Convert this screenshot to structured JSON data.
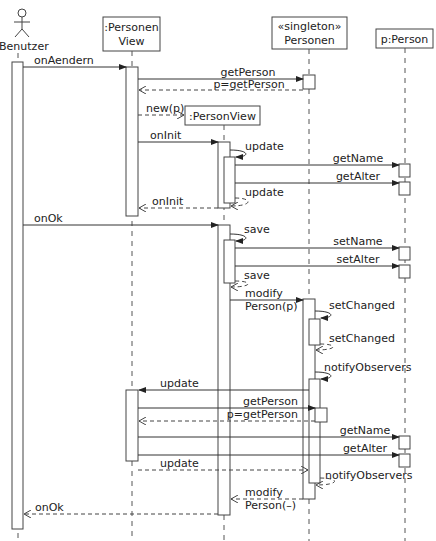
{
  "diagram": {
    "type": "UML sequence diagram",
    "participants": [
      {
        "id": "benutzer",
        "label": ":Benutzer",
        "kind": "actor"
      },
      {
        "id": "personenview",
        "label_line1": ":Personen",
        "label_line2": "View",
        "kind": "object"
      },
      {
        "id": "personen",
        "label_line1": "«singleton»",
        "label_line2": "Personen",
        "kind": "object"
      },
      {
        "id": "person",
        "label": "p:Person",
        "kind": "object"
      },
      {
        "id": "personview",
        "label": ":PersonView",
        "kind": "created-object"
      }
    ],
    "messages": [
      {
        "label": "onAendern",
        "from": "benutzer",
        "to": "personenview",
        "kind": "sync"
      },
      {
        "label": "getPerson",
        "from": "personenview",
        "to": "personen",
        "kind": "sync"
      },
      {
        "label": "p=getPerson",
        "from": "personen",
        "to": "personenview",
        "kind": "return"
      },
      {
        "label": "new(p)",
        "from": "personenview",
        "to": "personview",
        "kind": "create"
      },
      {
        "label": "onInit",
        "from": "personenview",
        "to": "personview",
        "kind": "sync"
      },
      {
        "label": "update",
        "from": "personview",
        "to": "personview",
        "kind": "self"
      },
      {
        "label": "getName",
        "from": "personview",
        "to": "person",
        "kind": "sync"
      },
      {
        "label": "getAlter",
        "from": "personview",
        "to": "person",
        "kind": "sync"
      },
      {
        "label": "update",
        "from": "personview",
        "to": "personview",
        "kind": "self-return"
      },
      {
        "label": "onInit",
        "from": "personview",
        "to": "personenview",
        "kind": "return"
      },
      {
        "label": "onOk",
        "from": "benutzer",
        "to": "personview",
        "kind": "sync"
      },
      {
        "label": "save",
        "from": "personview",
        "to": "personview",
        "kind": "self"
      },
      {
        "label": "setName",
        "from": "personview",
        "to": "person",
        "kind": "sync"
      },
      {
        "label": "setAlter",
        "from": "personview",
        "to": "person",
        "kind": "sync"
      },
      {
        "label": "save",
        "from": "personview",
        "to": "personview",
        "kind": "self-return"
      },
      {
        "label_line1": "modify",
        "label_line2": "Person(p)",
        "from": "personview",
        "to": "personen",
        "kind": "sync"
      },
      {
        "label": "setChanged",
        "from": "personen",
        "to": "personen",
        "kind": "self"
      },
      {
        "label": "setChanged",
        "from": "personen",
        "to": "personen",
        "kind": "self-return"
      },
      {
        "label": "notifyObservers",
        "from": "personen",
        "to": "personen",
        "kind": "self"
      },
      {
        "label": "update",
        "from": "personen",
        "to": "personenview",
        "kind": "sync"
      },
      {
        "label": "getPerson",
        "from": "personenview",
        "to": "personen",
        "kind": "sync"
      },
      {
        "label": "p=getPerson",
        "from": "personen",
        "to": "personenview",
        "kind": "return"
      },
      {
        "label": "getName",
        "from": "personenview",
        "to": "person",
        "kind": "sync"
      },
      {
        "label": "getAlter",
        "from": "personenview",
        "to": "person",
        "kind": "sync"
      },
      {
        "label": "update",
        "from": "personenview",
        "to": "personen",
        "kind": "return"
      },
      {
        "label": "notifyObservers",
        "from": "personen",
        "to": "personen",
        "kind": "self-return"
      },
      {
        "label_line1": "modify",
        "label_line2": "Person(–)",
        "from": "personen",
        "to": "personview",
        "kind": "return"
      },
      {
        "label": "onOk",
        "from": "personview",
        "to": "benutzer",
        "kind": "return"
      }
    ]
  },
  "colors": {
    "line": "#333333",
    "background": "#ffffff"
  }
}
